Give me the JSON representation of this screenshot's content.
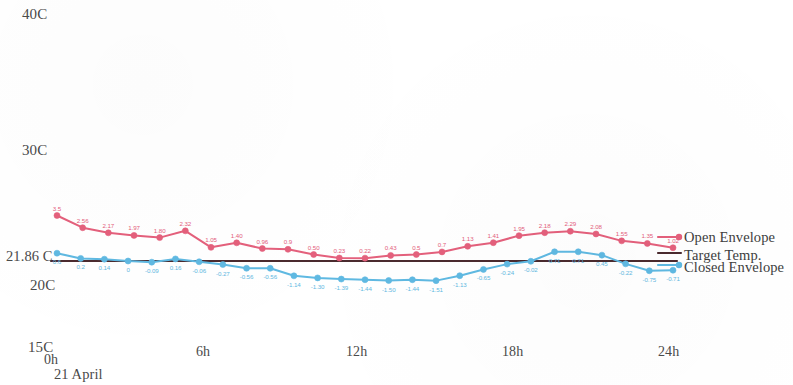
{
  "chart_data": {
    "type": "line",
    "title": "",
    "xlabel": "21 April",
    "ylabel": "",
    "x_tick_labels": [
      "0h",
      "6h",
      "12h",
      "18h",
      "24h"
    ],
    "x_tick_hours": [
      0,
      6,
      12,
      18,
      24
    ],
    "y_tick_labels": [
      "40C",
      "30C",
      "21.86 C",
      "20C",
      "15C"
    ],
    "y_tick_values": [
      40,
      30,
      21.86,
      20,
      15
    ],
    "ylim": [
      15,
      40
    ],
    "xlim": [
      0,
      24
    ],
    "grid": false,
    "legend_position": "right",
    "target_temp": 21.86,
    "hours": [
      0,
      0.8,
      1.6,
      2.4,
      3.2,
      4.0,
      4.8,
      5.6,
      6.4,
      7.2,
      8.0,
      8.8,
      9.6,
      10.4,
      11.2,
      12.0,
      12.8,
      13.6,
      14.4,
      15.2,
      16.0,
      16.8,
      17.6,
      18.4,
      19.2,
      20.0,
      20.8,
      21.6,
      22.4,
      23.2,
      24.0
    ],
    "series": [
      {
        "name": "Open Envelope",
        "color": "#e4607c",
        "marker": "circle",
        "deltas": [
          3.5,
          2.56,
          2.17,
          1.97,
          1.8,
          2.32,
          1.05,
          1.4,
          0.96,
          0.9,
          0.5,
          0.23,
          0.22,
          0.43,
          0.5,
          0.7,
          1.13,
          1.41,
          1.95,
          2.18,
          2.29,
          2.08,
          1.55,
          1.35,
          1.02
        ],
        "labels": [
          "3.5",
          "2.56",
          "2.17",
          "1.97",
          "1.80",
          "2.32",
          "1.05",
          "1.40",
          "0.96",
          "0.9",
          "0.50",
          "0.23",
          "0.22",
          "0.43",
          "0.5",
          "0.7",
          "1.13",
          "1.41",
          "1.95",
          "2.18",
          "2.29",
          "2.08",
          "1.55",
          "1.35",
          "1.02"
        ]
      },
      {
        "name": "Closed Envelope",
        "color": "#5fb9e2",
        "marker": "circle",
        "deltas": [
          0.6,
          0.2,
          0.14,
          0.0,
          -0.09,
          0.16,
          -0.06,
          -0.27,
          -0.56,
          -0.56,
          -1.14,
          -1.3,
          -1.39,
          -1.44,
          -1.5,
          -1.44,
          -1.51,
          -1.13,
          -0.65,
          -0.24,
          -0.02,
          0.71,
          0.71,
          0.45,
          -0.22,
          -0.75,
          -0.71
        ],
        "labels": [
          "0.6",
          "0.2",
          "0.14",
          "0",
          "-0.09",
          "0.16",
          "-0.06",
          "-0.27",
          "-0.56",
          "-0.56",
          "-1.14",
          "-1.30",
          "-1.39",
          "-1.44",
          "-1.50",
          "-1.44",
          "-1.51",
          "-1.13",
          "-0.65",
          "-0.24",
          "-0.02",
          "0.71",
          "0.71",
          "0.45",
          "-0.22",
          "-0.75",
          "-0.71"
        ]
      },
      {
        "name": "Target Temp.",
        "color": "#4a2a2e",
        "marker": "none",
        "constant": 21.86
      }
    ]
  },
  "axes": {
    "y_40": "40C",
    "y_30": "30C",
    "y_target": "21.86 C",
    "y_20": "20C",
    "y_15": "15C",
    "x_0": "0h",
    "x_6": "6h",
    "x_12": "12h",
    "x_18": "18h",
    "x_24": "24h",
    "date": "21 April"
  },
  "legend": {
    "open": "Open Envelope",
    "target": "Target Temp.",
    "closed": "Closed Envelope"
  },
  "colors": {
    "open": "#e4607c",
    "closed": "#5fb9e2",
    "target": "#4a2a2e",
    "text": "#4a4a4a",
    "background": "#ffffff"
  }
}
